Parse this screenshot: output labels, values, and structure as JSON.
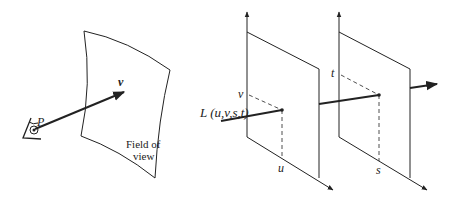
{
  "left_figure": {
    "point_label": "P",
    "vector_label": "v",
    "surface_label_line1": "Field of",
    "surface_label_line2": "view"
  },
  "right_figure": {
    "function_label": "L (u,v,s,t)",
    "plane1_horizontal_label": "u",
    "plane1_vertical_label": "v",
    "plane2_horizontal_label": "s",
    "plane2_vertical_label": "t"
  },
  "colors": {
    "stroke": "#222222",
    "background": "#ffffff"
  }
}
